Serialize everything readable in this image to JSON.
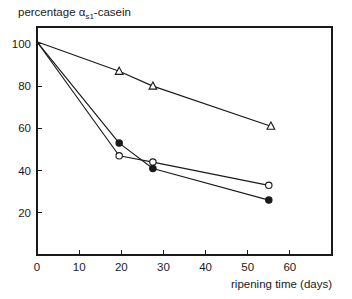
{
  "chart_data": {
    "type": "line",
    "title": "percentage αs1-casein",
    "title_main": "percentage α",
    "title_sub": "s1",
    "title_tail": "-casein",
    "xlabel": "ripening time (days)",
    "ylabel": "",
    "xlim": [
      0,
      70
    ],
    "ylim": [
      0,
      108
    ],
    "xticks": [
      0,
      10,
      20,
      30,
      40,
      50,
      60
    ],
    "yticks": [
      20,
      40,
      60,
      80,
      100
    ],
    "xtick_labels": [
      "0",
      "10",
      "20",
      "30",
      "40",
      "50",
      "60"
    ],
    "ytick_labels": [
      "20",
      "40",
      "60",
      "80",
      "100"
    ],
    "grid": false,
    "legend": "none",
    "frame": "box",
    "series": [
      {
        "name": "open-triangle-series",
        "marker": "triangle-open",
        "x": [
          0,
          19.5,
          27.5,
          55.5
        ],
        "y": [
          101,
          87,
          80,
          61
        ]
      },
      {
        "name": "open-circle-series",
        "marker": "circle-open",
        "x": [
          0,
          19.5,
          27.5,
          55
        ],
        "y": [
          101,
          47,
          44,
          33
        ]
      },
      {
        "name": "filled-circle-series",
        "marker": "circle-filled",
        "x": [
          0,
          19.5,
          27.5,
          55
        ],
        "y": [
          101,
          53,
          41,
          26
        ]
      }
    ]
  },
  "colors": {
    "ink": "#1a1a1a",
    "background": "#ffffff"
  }
}
